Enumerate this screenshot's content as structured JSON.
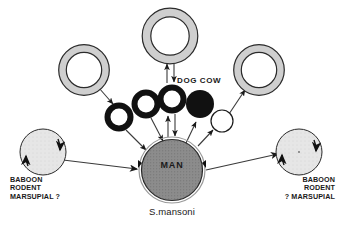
{
  "figure": {
    "caption": "S.mansoni",
    "center_node_label": "MAN",
    "dog_cow_label": "DOG  COW",
    "left_host_label_lines": [
      "BABOON",
      "RODENT",
      "MARSUPIAL ?"
    ],
    "right_host_label_lines": [
      "BABOON",
      "RODENT",
      "? MARSUPIAL"
    ],
    "colors": {
      "ink": "#1a1a1a",
      "background": "#ffffff",
      "center_fill": "#8c8c8c",
      "host_fill": "#e3e3e3",
      "snail_ring_light": "#cfcfcf",
      "snail_ring_dark": "#111111",
      "white_fill": "#ffffff"
    },
    "nodes": [
      {
        "name": "snail-ring-top",
        "type": "light-ring",
        "cx": 170,
        "cy": 36,
        "r": 24
      },
      {
        "name": "snail-ring-upper-left",
        "type": "light-ring",
        "cx": 84,
        "cy": 71,
        "r": 22
      },
      {
        "name": "snail-ring-upper-right",
        "type": "light-ring",
        "cx": 259,
        "cy": 71,
        "r": 22
      },
      {
        "name": "snail-ring-dark-1",
        "type": "dark-ring",
        "cx": 119,
        "cy": 118,
        "r": 13
      },
      {
        "name": "snail-ring-dark-2",
        "type": "dark-ring",
        "cx": 146,
        "cy": 105,
        "r": 13
      },
      {
        "name": "snail-ring-dark-3",
        "type": "dark-ring",
        "cx": 173,
        "cy": 100,
        "r": 13
      },
      {
        "name": "snail-solid-black",
        "type": "solid-black",
        "cx": 200,
        "cy": 105,
        "r": 14
      },
      {
        "name": "snail-white",
        "type": "white-circle",
        "cx": 222,
        "cy": 121,
        "r": 11
      },
      {
        "name": "host-left",
        "type": "host",
        "cx": 43,
        "cy": 152,
        "r": 23
      },
      {
        "name": "host-right",
        "type": "host",
        "cx": 299,
        "cy": 152,
        "r": 23
      },
      {
        "name": "node-man",
        "type": "center",
        "cx": 172,
        "cy": 170,
        "r": 33
      }
    ],
    "edges": [
      {
        "name": "edge-top-ring-to-dark3",
        "direction": "bidirectional"
      },
      {
        "name": "edge-dark3-to-man",
        "direction": "bidirectional"
      },
      {
        "name": "edge-upper-left-ring-to-dark1",
        "direction": "one-way"
      },
      {
        "name": "edge-dark1-to-man",
        "direction": "one-way"
      },
      {
        "name": "edge-dark2-to-man",
        "direction": "one-way"
      },
      {
        "name": "edge-man-to-solid-black",
        "direction": "one-way"
      },
      {
        "name": "edge-man-to-white",
        "direction": "one-way"
      },
      {
        "name": "edge-white-to-upper-right-ring",
        "direction": "one-way"
      },
      {
        "name": "edge-host-left-to-man",
        "direction": "one-way"
      },
      {
        "name": "edge-man-to-host-right",
        "direction": "one-way"
      },
      {
        "name": "edge-host-left-selfloop",
        "direction": "one-way"
      },
      {
        "name": "edge-host-right-selfloop",
        "direction": "one-way"
      }
    ]
  }
}
